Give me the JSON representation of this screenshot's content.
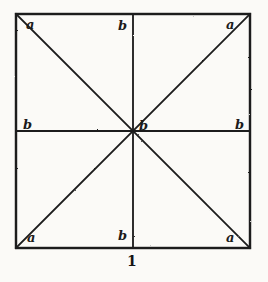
{
  "figure": {
    "caption": "1",
    "background_color": "#fbfaf7",
    "line_color": "#1b1b1b",
    "label_color": "#1b1b1b",
    "square": {
      "left": 16,
      "top": 14,
      "right": 250,
      "bottom": 248
    },
    "labels": {
      "top_left": "a",
      "top_center": "b",
      "top_right": "a",
      "middle_left": "b",
      "center": "b",
      "middle_right": "b",
      "bottom_left": "a",
      "bottom_center": "b",
      "bottom_right": "a"
    },
    "geometry": {
      "outline": "square",
      "diagonals": 2,
      "midlines": 2,
      "center_point": [
        133,
        131
      ]
    }
  }
}
